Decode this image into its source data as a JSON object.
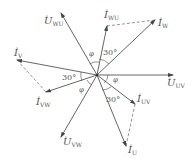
{
  "diagram": {
    "type": "phasor diagram",
    "center": [
      97,
      75
    ],
    "vectors": [
      {
        "id": "U_WU",
        "label": "U",
        "sub": "WU",
        "tip": [
          61,
          13
        ],
        "label_pos": [
          44,
          24
        ],
        "kind": "voltage"
      },
      {
        "id": "I_WU",
        "label": "I",
        "sub": "WU",
        "tip": [
          107,
          26
        ],
        "label_pos": [
          104,
          18
        ],
        "kind": "current"
      },
      {
        "id": "I_W",
        "label": "I",
        "sub": "W",
        "tip": [
          155,
          20
        ],
        "label_pos": [
          158,
          26
        ],
        "kind": "current"
      },
      {
        "id": "I_V",
        "label": "I",
        "sub": "V",
        "tip": [
          17,
          60
        ],
        "label_pos": [
          14,
          56
        ],
        "kind": "current"
      },
      {
        "id": "I_VW",
        "label": "I",
        "sub": "VW",
        "tip": [
          46,
          92
        ],
        "label_pos": [
          36,
          105
        ],
        "kind": "current"
      },
      {
        "id": "U_UV",
        "label": "U",
        "sub": "UV",
        "tip": [
          173,
          75
        ],
        "label_pos": [
          167,
          86
        ],
        "kind": "voltage"
      },
      {
        "id": "I_UV",
        "label": "I",
        "sub": "UV",
        "tip": [
          135,
          104
        ],
        "label_pos": [
          137,
          102
        ],
        "kind": "current"
      },
      {
        "id": "I_U",
        "label": "I",
        "sub": "U",
        "tip": [
          126,
          146
        ],
        "label_pos": [
          128,
          153
        ],
        "kind": "current"
      },
      {
        "id": "U_VW",
        "label": "U",
        "sub": "VW",
        "tip": [
          61,
          137
        ],
        "label_pos": [
          63,
          145
        ],
        "kind": "voltage"
      }
    ],
    "dashed_lines": [
      {
        "from": [
          107,
          26
        ],
        "to": [
          155,
          20
        ]
      },
      {
        "from": [
          17,
          60
        ],
        "to": [
          46,
          92
        ]
      },
      {
        "from": [
          135,
          104
        ],
        "to": [
          126,
          146
        ]
      }
    ],
    "angle_labels": [
      {
        "text": "30°",
        "pos": [
          103,
          55
        ]
      },
      {
        "text": "30°",
        "pos": [
          62,
          80
        ]
      },
      {
        "text": "30°",
        "pos": [
          106,
          102
        ]
      },
      {
        "text": "φ",
        "pos": [
          89,
          56
        ]
      },
      {
        "text": "φ",
        "pos": [
          113,
          82
        ]
      },
      {
        "text": "φ",
        "pos": [
          79,
          92
        ]
      }
    ]
  }
}
